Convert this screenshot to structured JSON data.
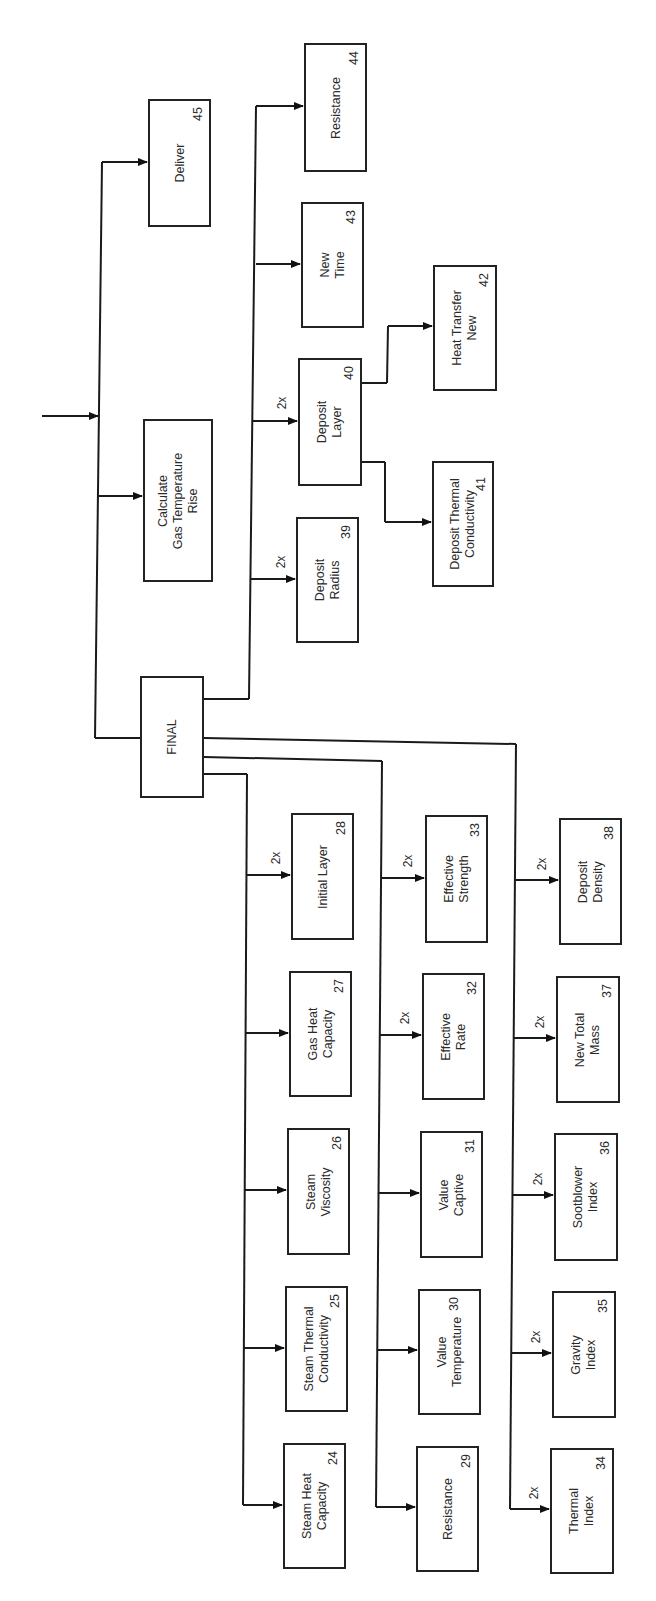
{
  "diagram": {
    "orientation": "rotated-90-ccw",
    "root": {
      "label": "FINAL"
    },
    "top_level": [
      {
        "id": "calc_gas",
        "lines": [
          "Calculate",
          "Gas Temperature",
          "Rise"
        ],
        "number": ""
      },
      {
        "id": "deliver",
        "lines": [
          "Deliver"
        ],
        "number": "45"
      }
    ],
    "final_upper_branch": [
      {
        "id": "b39",
        "lines": [
          "Deposit",
          "Radius"
        ],
        "number": "39",
        "multiplier": "2x"
      },
      {
        "id": "b40",
        "lines": [
          "Deposit",
          "Layer"
        ],
        "number": "40",
        "multiplier": "2x"
      },
      {
        "id": "b43",
        "lines": [
          "New",
          "Time"
        ],
        "number": "43",
        "multiplier": ""
      },
      {
        "id": "b44",
        "lines": [
          "Resistance"
        ],
        "number": "44",
        "multiplier": ""
      }
    ],
    "deposit_layer_children": [
      {
        "id": "b41",
        "lines": [
          "Deposit Thermal",
          "Conductivity"
        ],
        "number": "41"
      },
      {
        "id": "b42",
        "lines": [
          "Heat Transfer",
          "New"
        ],
        "number": "42"
      }
    ],
    "column_1": [
      {
        "id": "b28",
        "lines": [
          "Initial Layer"
        ],
        "number": "28",
        "multiplier": "2x"
      },
      {
        "id": "b27",
        "lines": [
          "Gas Heat",
          "Capacity"
        ],
        "number": "27",
        "multiplier": ""
      },
      {
        "id": "b26",
        "lines": [
          "Steam",
          "Viscosity"
        ],
        "number": "26",
        "multiplier": ""
      },
      {
        "id": "b25",
        "lines": [
          "Steam Thermal",
          "Conductivity"
        ],
        "number": "25",
        "multiplier": ""
      },
      {
        "id": "b24",
        "lines": [
          "Steam Heat",
          "Capacity"
        ],
        "number": "24",
        "multiplier": ""
      }
    ],
    "column_2": [
      {
        "id": "b33",
        "lines": [
          "Effective",
          "Strength"
        ],
        "number": "33",
        "multiplier": "2x"
      },
      {
        "id": "b32",
        "lines": [
          "Effective",
          "Rate"
        ],
        "number": "32",
        "multiplier": "2x"
      },
      {
        "id": "b31",
        "lines": [
          "Value",
          "Captive"
        ],
        "number": "31",
        "multiplier": ""
      },
      {
        "id": "b30",
        "lines": [
          "Value",
          "Temperature"
        ],
        "number": "30",
        "multiplier": ""
      },
      {
        "id": "b29",
        "lines": [
          "Resistance"
        ],
        "number": "29",
        "multiplier": ""
      }
    ],
    "column_3": [
      {
        "id": "b38",
        "lines": [
          "Deposit",
          "Density"
        ],
        "number": "38",
        "multiplier": "2x"
      },
      {
        "id": "b37",
        "lines": [
          "New Total",
          "Mass"
        ],
        "number": "37",
        "multiplier": "2x"
      },
      {
        "id": "b36",
        "lines": [
          "Sootblower",
          "Index"
        ],
        "number": "36",
        "multiplier": "2x"
      },
      {
        "id": "b35",
        "lines": [
          "Gravity",
          "Index"
        ],
        "number": "35",
        "multiplier": "2x"
      },
      {
        "id": "b34",
        "lines": [
          "Thermal",
          "Index"
        ],
        "number": "34",
        "multiplier": "2x"
      }
    ]
  }
}
